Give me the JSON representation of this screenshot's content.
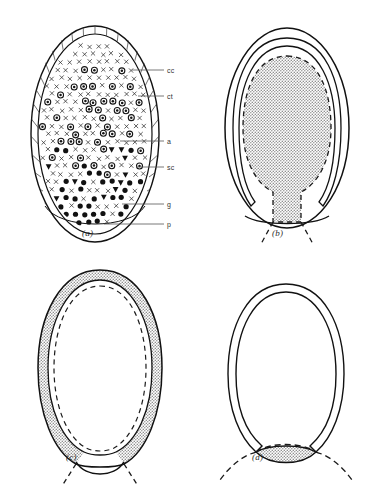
{
  "figure": {
    "panels": [
      {
        "id": "a",
        "caption": "(a)"
      },
      {
        "id": "b",
        "caption": "(b)"
      },
      {
        "id": "c",
        "caption": "(c)"
      },
      {
        "id": "d",
        "caption": "(d)"
      }
    ],
    "labels": [
      {
        "key": "cc",
        "text": "cc"
      },
      {
        "key": "ct",
        "text": "ct"
      },
      {
        "key": "a",
        "text": "a"
      },
      {
        "key": "sc",
        "text": "sc"
      },
      {
        "key": "g",
        "text": "g"
      },
      {
        "key": "p",
        "text": "p"
      }
    ],
    "colors": {
      "outline": "#111111",
      "shade_fill": "#b8b8b8",
      "background": "#ffffff",
      "label_text": "#333333",
      "leader_line": "#555555"
    },
    "chart_data": {
      "type": "diagram",
      "title": "",
      "description": "Four schematic ovoid cross-sections showing distribution of cell populations and progressive regional shading.",
      "panels": [
        {
          "id": "a",
          "caption": "(a)",
          "shading": "none",
          "annotated": true,
          "leader_labels": [
            "cc",
            "ct",
            "a",
            "sc",
            "g",
            "p"
          ],
          "regions": [
            {
              "name": "hatched-rim",
              "symbol": "radial-ticks",
              "label_key": "cc"
            },
            {
              "name": "outer-band",
              "symbol": "hatch",
              "label_key": "ct"
            },
            {
              "name": "interior-mixed",
              "symbol": "x-marks-and-ringed-circles",
              "label_key": "a"
            },
            {
              "name": "mid-lower",
              "symbol": "filled-triangles",
              "label_key": "sc"
            },
            {
              "name": "basal-granules",
              "symbol": "solid-dots",
              "label_key": "g"
            },
            {
              "name": "basal-layer",
              "symbol": "small-dot-row",
              "label_key": "p"
            }
          ]
        },
        {
          "id": "b",
          "caption": "(b)",
          "shading": "central-core",
          "annotated": false,
          "shade_extent": "large central mass reaching from apex to base, tapering to a narrow basal stalk",
          "dashed_boundary": true,
          "dashed_extensions": "V-shaped pair below base"
        },
        {
          "id": "c",
          "caption": "(c)",
          "shading": "peripheral-ring",
          "annotated": false,
          "shade_extent": "outer shell/ring surrounding an unshaded core, thinning toward base",
          "dashed_boundary": true,
          "dashed_extensions": "V-shaped pair below base"
        },
        {
          "id": "d",
          "caption": "(d)",
          "shading": "basal-lens",
          "annotated": false,
          "shade_extent": "small lens-shaped patch confined to the base",
          "dashed_boundary": true,
          "dashed_extensions": "wide shallow arc spanning below base"
        }
      ]
    }
  }
}
